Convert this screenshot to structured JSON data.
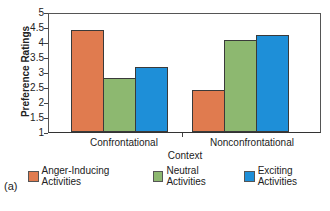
{
  "chart_data": {
    "type": "bar",
    "title": "",
    "panel_label": "(a)",
    "xlabel": "Context",
    "ylabel": "Preference Ratings",
    "ylim": [
      1,
      5
    ],
    "yticks": [
      "5",
      "4.5",
      "4",
      "3.5",
      "3",
      "2.5",
      "2",
      "1.5",
      "1"
    ],
    "categories": [
      "Confrontational",
      "Nonconfrontational"
    ],
    "series": [
      {
        "name": "Anger-Inducing Activities",
        "color": "#e07b4f",
        "values": [
          4.43,
          2.4
        ]
      },
      {
        "name": "Neutral Activities",
        "color": "#8db870",
        "values": [
          2.83,
          4.1
        ]
      },
      {
        "name": "Exciting Activities",
        "color": "#1e8fd8",
        "values": [
          3.2,
          4.27
        ]
      }
    ],
    "legend_position": "bottom",
    "grid": false
  }
}
